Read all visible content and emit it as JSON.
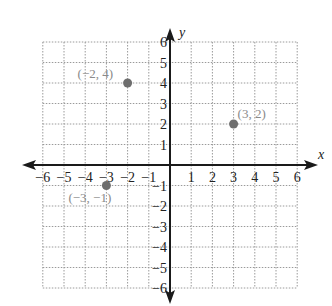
{
  "chart_data": {
    "type": "scatter",
    "title": "",
    "xlabel": "x",
    "ylabel": "y",
    "xlim": [
      -6,
      6
    ],
    "ylim": [
      -6,
      6
    ],
    "grid": true,
    "x_ticks": [
      -6,
      -5,
      -4,
      -3,
      -2,
      -1,
      1,
      2,
      3,
      4,
      5,
      6
    ],
    "y_ticks": [
      -6,
      -5,
      -4,
      -3,
      -2,
      -1,
      1,
      2,
      3,
      4,
      5,
      6
    ],
    "x_tick_labels": [
      "−6",
      "−5",
      "−4",
      "−3",
      "−2",
      "−1",
      "1",
      "2",
      "3",
      "4",
      "5",
      "6"
    ],
    "y_tick_labels": [
      "−6",
      "−5",
      "−4",
      "−3",
      "−2",
      "−1",
      "1",
      "2",
      "3",
      "4",
      "5",
      "6"
    ],
    "points": [
      {
        "x": -2,
        "y": 4,
        "label": "(−2, 4)"
      },
      {
        "x": 3,
        "y": 2,
        "label": "(3, 2)"
      },
      {
        "x": -3,
        "y": -1,
        "label": "(−3, −1)"
      }
    ],
    "colors": {
      "axis": "#1a1a1a",
      "grid": "#9a9a9a",
      "point": "#6e6e6e",
      "point_label": "#8a8a8a"
    }
  }
}
